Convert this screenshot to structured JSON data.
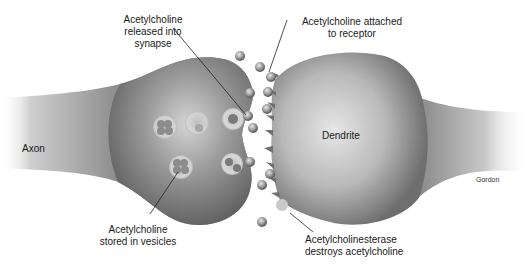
{
  "diagram": {
    "structures": {
      "axon": "Axon",
      "dendrite": "Dendrite"
    },
    "callouts": {
      "released": {
        "line1": "Acetylcholine",
        "line2": "released into",
        "line3": "synapse"
      },
      "attached": {
        "line1": "Acetylcholine attached",
        "line2": "to receptor"
      },
      "stored": {
        "line1": "Acetylcholine",
        "line2": "stored in vesicles"
      },
      "esterase": {
        "line1": "Acetylcholinesterase",
        "line2": "destroys acetylcholine"
      }
    },
    "credit": "Gordon",
    "colors": {
      "membrane_dark": "#5a5a5a",
      "membrane_mid": "#8a8a8a",
      "membrane_light": "#d6d6d6",
      "molecule": "#9a9a9a",
      "leader_line": "#222222"
    }
  }
}
